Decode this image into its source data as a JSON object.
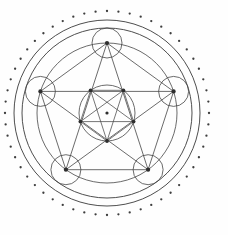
{
  "figure": {
    "title": "Pentagram Mandala",
    "description": "Sacred-geometry line drawing: a dotted outer ring, two concentric circles, a regular pentagon whose five vertices each carry a small circle, the complete K5 graph of chords forming a pentagram, and a smaller inverted pentagon with its own pentagram inside a central circle.",
    "background_color": "#fefefe",
    "line_color": "#3a3a3a",
    "dot_color": "#3d3d3d",
    "node_color": "#2e2e2e"
  },
  "geometry": {
    "canvas": {
      "width": 228,
      "height": 235
    },
    "center": {
      "x": 107,
      "y": 113
    },
    "dotted_ring": {
      "radius": 102,
      "dot_count": 56,
      "dot_radius": 1.15,
      "start_angle_deg": -90
    },
    "circles": [
      {
        "name": "outer-circle",
        "radius": 93
      },
      {
        "name": "second-circle",
        "radius": 85
      },
      {
        "name": "pentagon-circumcircle",
        "radius": 70
      },
      {
        "name": "inner-circle",
        "radius": 28
      }
    ],
    "outer_pentagon": {
      "circumradius": 70,
      "rotation_deg": -90,
      "vertex_circle_radius": 15,
      "vertices": [
        {
          "label": "top",
          "x": 107.0,
          "y": 43.0
        },
        {
          "label": "right",
          "x": 173.6,
          "y": 91.4
        },
        {
          "label": "bottom-right",
          "x": 148.1,
          "y": 169.7
        },
        {
          "label": "bottom-left",
          "x": 65.9,
          "y": 169.7
        },
        {
          "label": "left",
          "x": 40.4,
          "y": 91.4
        }
      ],
      "edges": [
        [
          0,
          1
        ],
        [
          1,
          2
        ],
        [
          2,
          3
        ],
        [
          3,
          4
        ],
        [
          4,
          0
        ],
        [
          0,
          2
        ],
        [
          0,
          3
        ],
        [
          1,
          3
        ],
        [
          1,
          4
        ],
        [
          2,
          4
        ]
      ],
      "edge_count": 10
    },
    "inner_pentagon": {
      "circumradius": 28,
      "rotation_deg": 90,
      "vertices": [
        {
          "label": "bottom",
          "x": 107.0,
          "y": 141.0
        },
        {
          "label": "left",
          "x": 80.4,
          "y": 121.6
        },
        {
          "label": "upper-left",
          "x": 90.6,
          "y": 90.3
        },
        {
          "label": "upper-right",
          "x": 123.4,
          "y": 90.3
        },
        {
          "label": "right",
          "x": 133.6,
          "y": 121.6
        }
      ],
      "edges": [
        [
          0,
          1
        ],
        [
          1,
          2
        ],
        [
          2,
          3
        ],
        [
          3,
          4
        ],
        [
          4,
          0
        ],
        [
          0,
          2
        ],
        [
          0,
          3
        ],
        [
          1,
          3
        ],
        [
          1,
          4
        ],
        [
          2,
          4
        ]
      ],
      "edge_count": 10
    },
    "center_node": {
      "x": 107,
      "y": 113,
      "radius": 1.6
    }
  },
  "legend": {
    "caption": ""
  }
}
